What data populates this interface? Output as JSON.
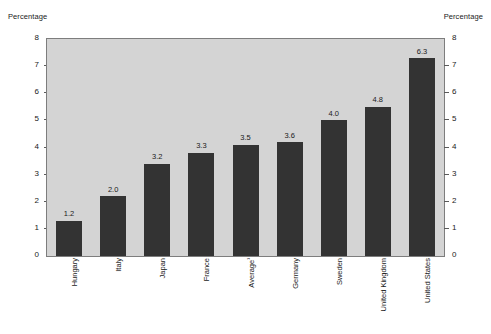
{
  "axis_caption_left": "Percentage",
  "axis_caption_right": "Percentage",
  "chart_data": {
    "type": "bar",
    "title": "",
    "subtitle": "",
    "xlabel": "",
    "ylabel": "Percentage",
    "ylabel_right": "Percentage",
    "ylim": [
      0,
      8
    ],
    "yticks": [
      0,
      1,
      2,
      3,
      4,
      5,
      6,
      7,
      8
    ],
    "ytick_labels": [
      "0",
      "1",
      "2",
      "3",
      "4",
      "5",
      "6",
      "7",
      "8"
    ],
    "grid": false,
    "legend": null,
    "categories": [
      "Hungary",
      "Italy",
      "Japan",
      "France",
      "Average¹",
      "Germany",
      "Sweden",
      "United Kingdom",
      "United States"
    ],
    "category_footnotes": {
      "Average¹": "1"
    },
    "values": [
      1.2,
      2.0,
      3.2,
      3.3,
      3.5,
      3.6,
      4.0,
      4.8,
      6.3
    ],
    "data_labels": [
      "1.2",
      "2.0",
      "3.2",
      "3.3",
      "3.5",
      "3.6",
      "4.0",
      "4.8",
      "6.3"
    ],
    "plotted_heights": [
      1.3,
      2.2,
      3.4,
      3.8,
      4.1,
      4.2,
      5.0,
      5.5,
      7.3
    ],
    "bar_color": "#333333",
    "plot_background": "#d4d4d4",
    "frame_color": "#7d7d7d",
    "page_background": "#ffffff",
    "text_color": "#1a1a1a"
  }
}
